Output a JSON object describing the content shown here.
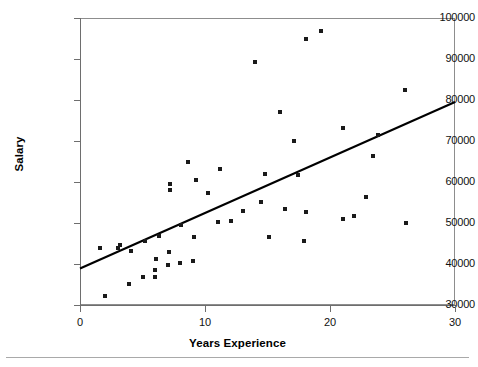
{
  "chart_data": {
    "type": "scatter",
    "title": "",
    "xlabel": "Years Experience",
    "ylabel": "Salary",
    "xlim": [
      0,
      30
    ],
    "ylim": [
      30000,
      100000
    ],
    "xticks": [
      0,
      10,
      20,
      30
    ],
    "xtick_labels": [
      "0",
      "10",
      "20",
      "30"
    ],
    "yticks": [
      30000,
      40000,
      50000,
      60000,
      70000,
      80000,
      90000,
      100000
    ],
    "ytick_labels": [
      "30000",
      "40000",
      "50000",
      "60000",
      "70000",
      "80000",
      "90000",
      "100000"
    ],
    "grid": false,
    "legend": false,
    "marker": "square",
    "marker_color": "#1a1a1a",
    "trendline": {
      "type": "linear",
      "color": "#000000",
      "intercept": 38900,
      "slope": 1353,
      "x_start": 0,
      "x_end": 30,
      "y_start": 38900,
      "y_end": 79500
    },
    "points": [
      {
        "x": 2.0,
        "y": 32100
      },
      {
        "x": 1.6,
        "y": 43800
      },
      {
        "x": 3.0,
        "y": 44000
      },
      {
        "x": 3.2,
        "y": 44600
      },
      {
        "x": 3.9,
        "y": 35200
      },
      {
        "x": 4.1,
        "y": 43100
      },
      {
        "x": 5.0,
        "y": 36900
      },
      {
        "x": 5.2,
        "y": 45600
      },
      {
        "x": 6.0,
        "y": 36800
      },
      {
        "x": 6.0,
        "y": 38500
      },
      {
        "x": 6.1,
        "y": 41200
      },
      {
        "x": 6.3,
        "y": 46800
      },
      {
        "x": 7.0,
        "y": 39700
      },
      {
        "x": 7.1,
        "y": 42900
      },
      {
        "x": 7.2,
        "y": 58000
      },
      {
        "x": 7.2,
        "y": 59500
      },
      {
        "x": 8.0,
        "y": 40200
      },
      {
        "x": 8.1,
        "y": 49600
      },
      {
        "x": 8.6,
        "y": 64800
      },
      {
        "x": 9.0,
        "y": 40800
      },
      {
        "x": 9.1,
        "y": 46700
      },
      {
        "x": 9.3,
        "y": 60500
      },
      {
        "x": 10.2,
        "y": 57400
      },
      {
        "x": 11.0,
        "y": 50300
      },
      {
        "x": 11.2,
        "y": 63200
      },
      {
        "x": 12.1,
        "y": 50400
      },
      {
        "x": 13.0,
        "y": 53000
      },
      {
        "x": 14.0,
        "y": 89200
      },
      {
        "x": 14.5,
        "y": 55200
      },
      {
        "x": 14.8,
        "y": 62000
      },
      {
        "x": 15.1,
        "y": 46500
      },
      {
        "x": 16.0,
        "y": 77100
      },
      {
        "x": 16.4,
        "y": 53300
      },
      {
        "x": 17.1,
        "y": 70100
      },
      {
        "x": 17.4,
        "y": 61700
      },
      {
        "x": 17.9,
        "y": 45600
      },
      {
        "x": 18.1,
        "y": 52600
      },
      {
        "x": 18.1,
        "y": 94800
      },
      {
        "x": 19.3,
        "y": 96800
      },
      {
        "x": 21.0,
        "y": 51000
      },
      {
        "x": 21.9,
        "y": 51700
      },
      {
        "x": 21.0,
        "y": 73200
      },
      {
        "x": 22.9,
        "y": 56300
      },
      {
        "x": 23.8,
        "y": 71400
      },
      {
        "x": 26.0,
        "y": 82500
      },
      {
        "x": 26.1,
        "y": 50100
      },
      {
        "x": 23.4,
        "y": 66300
      }
    ]
  },
  "axes": {
    "y_title": "Salary",
    "x_title": "Years Experience"
  }
}
